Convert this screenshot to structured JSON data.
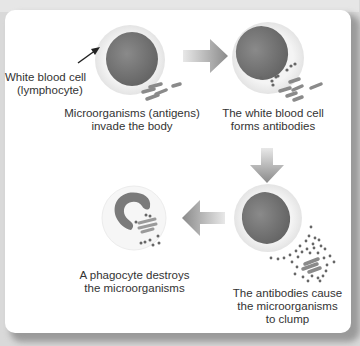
{
  "diagram": {
    "title_partial": "...",
    "steps": [
      {
        "id": "lymphocyte",
        "lines": [
          "White blood cell",
          "(lymphocyte)"
        ]
      },
      {
        "id": "invade",
        "lines": [
          "Microorganisms (antigens)",
          "invade the body"
        ]
      },
      {
        "id": "antibodies",
        "lines": [
          "The white blood cell",
          "forms antibodies"
        ]
      },
      {
        "id": "clump",
        "lines": [
          "The antibodies cause",
          "the microorganisms",
          "to clump"
        ]
      },
      {
        "id": "phagocyte",
        "lines": [
          "A phagocyte destroys",
          "the microorganisms"
        ]
      }
    ],
    "colors": {
      "nucleus": "#7a7a7a",
      "cell_halo": "#eeeeee",
      "arrow": "#8c8c8c",
      "particles": "#888888",
      "text": "#333333"
    },
    "flow": [
      "lymphocyte -> antibodies",
      "antibodies -> clump",
      "clump -> phagocyte"
    ]
  }
}
